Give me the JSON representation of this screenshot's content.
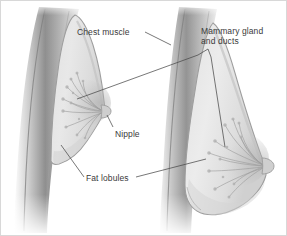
{
  "figure": {
    "background_color": "#ffffff",
    "border_color": "#d8d8d8",
    "label_color": "#3a3a3a",
    "leader_line_color": "#4a4a4a"
  },
  "palette": {
    "chest_muscle_dark": "#8e8e8e",
    "chest_muscle_mid": "#a9a9a9",
    "chest_muscle_light": "#c6c6c6",
    "breast_fill_light": "#e6e6e6",
    "breast_fill_mid": "#d5d5d5",
    "breast_outline": "#9a9a9a",
    "gland_duct": "#9d9d9d",
    "nipple": "#c2c2c2",
    "skin_edge": "#b4b4b4"
  },
  "labels": {
    "chest_muscle": {
      "text": "Chest muscle",
      "lines": [
        "Chest muscle"
      ]
    },
    "mammary_gland": {
      "text": "Mammary gland and ducts",
      "lines": [
        "Mammary gland",
        "and ducts"
      ]
    },
    "nipple": {
      "text": "Nipple",
      "lines": [
        "Nipple"
      ]
    },
    "fat_lobules": {
      "text": "Fat lobules",
      "lines": [
        "Fat lobules"
      ]
    }
  },
  "structures": {
    "left_figure": {
      "name": "small breast cross-section",
      "chest_wall": "vertical dark band at left",
      "nipple_position": "right side, mid-height"
    },
    "right_figure": {
      "name": "large breast cross-section",
      "chest_wall": "vertical dark band at center",
      "nipple_position": "right side, lower-mid height"
    }
  }
}
